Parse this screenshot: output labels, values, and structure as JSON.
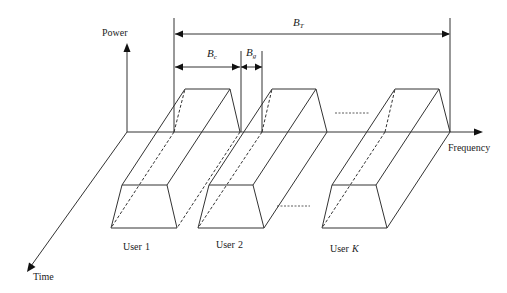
{
  "axes": {
    "power": "Power",
    "frequency": "Frequency",
    "time": "Time"
  },
  "bandwidths": {
    "total": {
      "symbol": "B",
      "subscript": "T"
    },
    "channel": {
      "symbol": "B",
      "subscript": "c"
    },
    "guard": {
      "symbol": "B",
      "subscript": "g"
    }
  },
  "users": [
    {
      "prefix": "User",
      "id": "1"
    },
    {
      "prefix": "User",
      "id": "2"
    },
    {
      "prefix": "User",
      "id": "K",
      "id_italic": true
    }
  ],
  "colors": {
    "line": "#333333",
    "text": "#222222",
    "background": "#ffffff"
  }
}
